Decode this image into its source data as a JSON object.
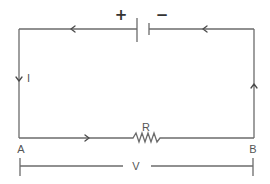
{
  "diagram": {
    "type": "electric-circuit",
    "labels": {
      "battery_positive": "+",
      "battery_negative": "−",
      "current": "I",
      "resistor": "R",
      "node_a": "A",
      "node_b": "B",
      "voltage": "V"
    },
    "components": [
      {
        "type": "battery",
        "position": "top",
        "positive_side": "left"
      },
      {
        "type": "resistor",
        "label": "R",
        "position": "bottom"
      }
    ],
    "current_direction": "clockwise-from-battery-positive: top wire leftward, left wire downward, bottom wire rightward, right wire upward",
    "colors": {
      "wire": "#6b6b6b",
      "text": "#555555",
      "background": "#ffffff"
    }
  }
}
